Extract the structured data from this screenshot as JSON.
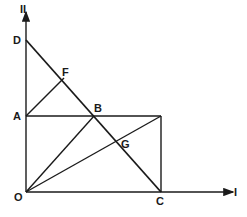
{
  "diagram": {
    "axes": {
      "x_label": "I",
      "y_label": "II"
    },
    "points": {
      "O": "O",
      "A": "A",
      "B": "B",
      "C": "C",
      "D": "D",
      "F": "F",
      "G": "G"
    },
    "colors": {
      "stroke": "#1a1a1a",
      "background": "#ffffff"
    }
  }
}
